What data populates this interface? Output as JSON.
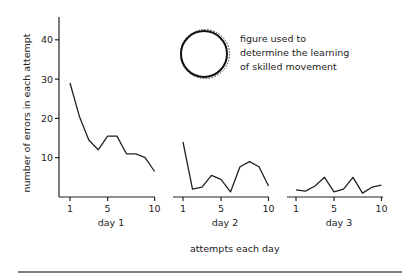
{
  "chart_data": {
    "type": "line",
    "title": "",
    "ylabel": "number of errors in each attempt",
    "xlabel": "attempts each day",
    "ylim": [
      0,
      45
    ],
    "yticks": [
      10,
      20,
      30,
      40
    ],
    "grid": false,
    "legend": "none",
    "annotation": {
      "text_lines": [
        "figure used to",
        "determine the learning",
        "of skilled movement"
      ],
      "figure": "circle"
    },
    "panels": [
      {
        "name": "day 1",
        "xticks": [
          1,
          5,
          10
        ],
        "x": [
          1,
          2,
          3,
          4,
          5,
          6,
          7,
          8,
          9,
          10
        ],
        "values": [
          29,
          20.5,
          14.5,
          12,
          15.5,
          15.5,
          11,
          11,
          10,
          6.5
        ]
      },
      {
        "name": "day 2",
        "xticks": [
          1,
          5,
          10
        ],
        "x": [
          1,
          2,
          3,
          4,
          5,
          6,
          7,
          8,
          9,
          10
        ],
        "values": [
          14,
          2,
          2.5,
          5.5,
          4.5,
          1.3,
          7.7,
          9,
          7.7,
          2.8
        ]
      },
      {
        "name": "day 3",
        "xticks": [
          1,
          5,
          10
        ],
        "x": [
          1,
          2,
          3,
          4,
          5,
          6,
          7,
          8,
          9,
          10
        ],
        "values": [
          1.8,
          1.5,
          2.8,
          5,
          1.3,
          2,
          5,
          1,
          2.5,
          3
        ]
      }
    ]
  }
}
